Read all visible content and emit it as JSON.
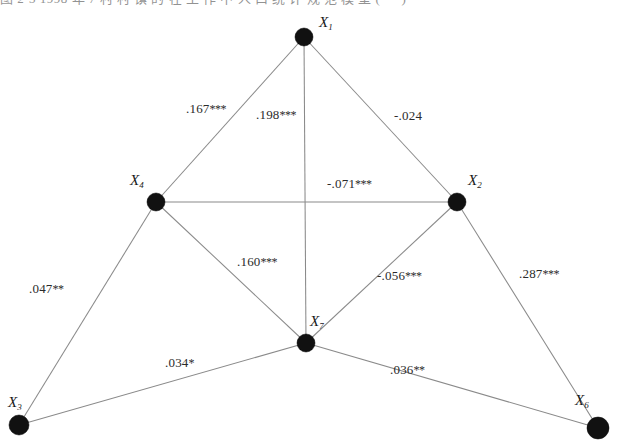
{
  "caption": {
    "text": "图 2-3   1998 年 7 村 村 镇 的 在 工 作 中 人 口 统 计 规 范 模 型   ( 一 )"
  },
  "figure": {
    "type": "path-diagram",
    "nodes": [
      {
        "id": "X1",
        "label": "X",
        "sub": "1",
        "cx": 304,
        "cy": 37,
        "r": 9,
        "label_x": 319,
        "label_y": 14
      },
      {
        "id": "X4",
        "label": "X",
        "sub": "4",
        "cx": 156,
        "cy": 202,
        "r": 9,
        "label_x": 130,
        "label_y": 172
      },
      {
        "id": "X2",
        "label": "X",
        "sub": "2",
        "cx": 457,
        "cy": 202,
        "r": 9,
        "label_x": 468,
        "label_y": 172
      },
      {
        "id": "X7",
        "label": "X",
        "sub": "7",
        "cx": 306,
        "cy": 343,
        "r": 9,
        "label_x": 310,
        "label_y": 313
      },
      {
        "id": "X3",
        "label": "X",
        "sub": "3",
        "cx": 19,
        "cy": 425,
        "r": 10,
        "label_x": 8,
        "label_y": 394
      },
      {
        "id": "X6",
        "label": "X",
        "sub": "6",
        "cx": 598,
        "cy": 428,
        "r": 11,
        "label_x": 575,
        "label_y": 392
      }
    ],
    "edges": [
      {
        "id": "e_X1_X4",
        "from": "X1",
        "to": "X4",
        "coefficient": ".167",
        "stars": "***",
        "label_x": 186,
        "label_y": 101,
        "significance": "p<.001"
      },
      {
        "id": "e_X1_X7",
        "from": "X1",
        "to": "X7",
        "coefficient": ".198",
        "stars": "***",
        "label_x": 256,
        "label_y": 107,
        "significance": "p<.001"
      },
      {
        "id": "e_X1_X2",
        "from": "X1",
        "to": "X2",
        "coefficient": "-.024",
        "stars": "",
        "label_x": 394,
        "label_y": 108,
        "significance": "n.s."
      },
      {
        "id": "e_X4_X2",
        "from": "X4",
        "to": "X2",
        "coefficient": "-.071",
        "stars": "***",
        "label_x": 327,
        "label_y": 176,
        "significance": "p<.001"
      },
      {
        "id": "e_X4_X7",
        "from": "X4",
        "to": "X7",
        "coefficient": ".160",
        "stars": "***",
        "label_x": 237,
        "label_y": 254,
        "significance": "p<.001"
      },
      {
        "id": "e_X2_X7",
        "from": "X2",
        "to": "X7",
        "coefficient": "-.056",
        "stars": "***",
        "label_x": 377,
        "label_y": 268,
        "significance": "p<.001"
      },
      {
        "id": "e_X2_X6",
        "from": "X2",
        "to": "X6",
        "coefficient": ".287",
        "stars": "***",
        "label_x": 519,
        "label_y": 266,
        "significance": "p<.001"
      },
      {
        "id": "e_X4_X3",
        "from": "X4",
        "to": "X3",
        "coefficient": ".047",
        "stars": "**",
        "label_x": 29,
        "label_y": 281,
        "significance": "p<.01"
      },
      {
        "id": "e_X3_X7",
        "from": "X3",
        "to": "X7",
        "coefficient": ".034",
        "stars": "*",
        "label_x": 165,
        "label_y": 355,
        "significance": "p<.05"
      },
      {
        "id": "e_X7_X6",
        "from": "X7",
        "to": "X6",
        "coefficient": ".036",
        "stars": "**",
        "label_x": 390,
        "label_y": 362,
        "significance": "p<.01"
      }
    ]
  }
}
